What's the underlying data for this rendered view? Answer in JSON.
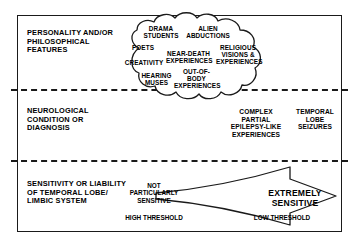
{
  "diagram": {
    "bands": [
      {
        "id": "personality",
        "label": "PERSONALITY AND/OR PHILOSOPHICAL FEATURES"
      },
      {
        "id": "neurological",
        "label": "NEUROLOGICAL CONDITION OR DIAGNOSIS"
      },
      {
        "id": "sensitivity",
        "label": "SENSITIVITY OR LIABILITY OF TEMPORAL LOBE/ LIMBIC SYSTEM"
      }
    ],
    "cloud": {
      "shape": "thought-cloud",
      "terms": [
        "DRAMA STUDENTS",
        "ALIEN ABDUCTIONS",
        "POETS",
        "NEAR-DEATH EXPERIENCES",
        "RELIGIOUS VISIONS & EXPERIENCES",
        "CREATIVITY",
        "HEARING MUSES",
        "OUT-OF-BODY EXPERIENCES"
      ]
    },
    "conditions": [
      "COMPLEX PARTIAL EPILEPSY-LIKE EXPERIENCES",
      "TEMPORAL LOBE SEIZURES"
    ],
    "sensitivity_scale": {
      "left_label": "NOT PARTICULARLY SENSITIVE",
      "right_label": "EXTREMELY SENSITIVE",
      "left_threshold": "HIGH THRESHOLD",
      "right_threshold": "LOW THRESHOLD",
      "arrow_direction": "right"
    },
    "colors": {
      "ink": "#1a1a1a",
      "background": "#ffffff"
    }
  }
}
